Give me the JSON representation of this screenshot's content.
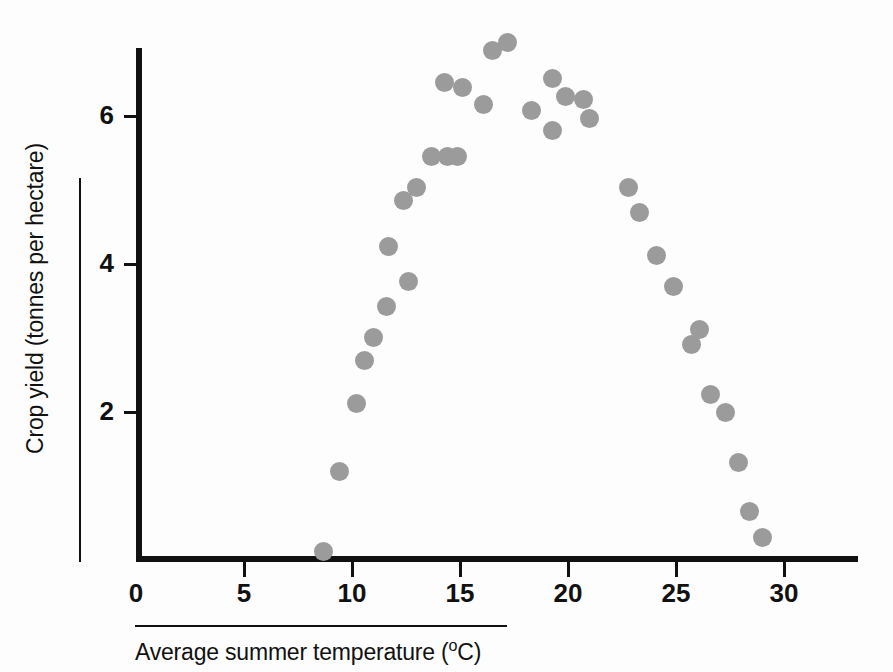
{
  "chart_data": {
    "type": "scatter",
    "title": "",
    "xlabel": "Average summer temperature (°C)",
    "ylabel": "Crop yield (tonnes per hectare)",
    "xlim": [
      0,
      33.4
    ],
    "ylim": [
      0,
      7.45
    ],
    "xticks": [
      0,
      5,
      10,
      15,
      20,
      25,
      30
    ],
    "xtick_labels": [
      "0",
      "5",
      "10",
      "15",
      "20",
      "25",
      "30"
    ],
    "yticks": [
      2,
      4,
      6
    ],
    "ytick_labels": [
      "2",
      "4",
      "6"
    ],
    "grid": false,
    "legend": null,
    "marker": {
      "shape": "circle",
      "color": "#9b9b9b",
      "size_px": 19
    },
    "points": [
      {
        "x": 8.7,
        "y": 0.11
      },
      {
        "x": 9.4,
        "y": 1.19
      },
      {
        "x": 10.2,
        "y": 2.12
      },
      {
        "x": 10.6,
        "y": 2.7
      },
      {
        "x": 11.0,
        "y": 3.01
      },
      {
        "x": 11.6,
        "y": 3.42
      },
      {
        "x": 11.7,
        "y": 4.24
      },
      {
        "x": 12.4,
        "y": 4.86
      },
      {
        "x": 12.6,
        "y": 3.77
      },
      {
        "x": 13.0,
        "y": 5.04
      },
      {
        "x": 13.7,
        "y": 5.45
      },
      {
        "x": 14.3,
        "y": 6.45
      },
      {
        "x": 14.4,
        "y": 5.45
      },
      {
        "x": 14.9,
        "y": 5.45
      },
      {
        "x": 15.1,
        "y": 6.38
      },
      {
        "x": 16.1,
        "y": 6.16
      },
      {
        "x": 16.5,
        "y": 6.89
      },
      {
        "x": 17.2,
        "y": 7.0
      },
      {
        "x": 18.3,
        "y": 6.08
      },
      {
        "x": 19.3,
        "y": 6.51
      },
      {
        "x": 19.3,
        "y": 5.8
      },
      {
        "x": 19.9,
        "y": 6.27
      },
      {
        "x": 20.7,
        "y": 6.22
      },
      {
        "x": 21.0,
        "y": 5.97
      },
      {
        "x": 22.8,
        "y": 5.04
      },
      {
        "x": 23.3,
        "y": 4.69
      },
      {
        "x": 24.1,
        "y": 4.11
      },
      {
        "x": 24.9,
        "y": 3.7
      },
      {
        "x": 25.7,
        "y": 2.91
      },
      {
        "x": 26.1,
        "y": 3.11
      },
      {
        "x": 26.6,
        "y": 2.23
      },
      {
        "x": 27.3,
        "y": 1.99
      },
      {
        "x": 27.9,
        "y": 1.32
      },
      {
        "x": 28.4,
        "y": 0.65
      },
      {
        "x": 29.0,
        "y": 0.3
      }
    ]
  },
  "axes": {
    "y_label_text": "Crop yield (tonnes per hectare)",
    "x_label_main": "Average summer temperature (",
    "x_label_degree": "o",
    "x_label_tail": "C)"
  }
}
